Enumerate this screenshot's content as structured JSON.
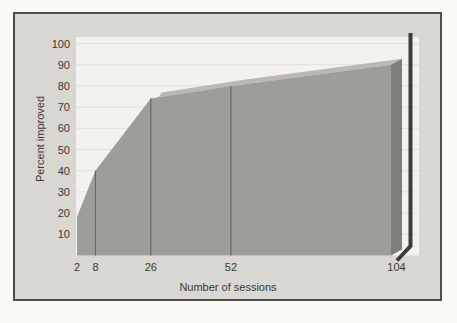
{
  "chart_data": {
    "type": "area",
    "style": "3d-extruded-area",
    "title": "",
    "xlabel": "Number of sessions",
    "ylabel": "Percent improved",
    "x": [
      2,
      8,
      26,
      52,
      104
    ],
    "values": [
      18,
      40,
      74,
      80,
      90
    ],
    "x_tick_labels": [
      "2",
      "8",
      "26",
      "52",
      "104"
    ],
    "y_ticks": [
      10,
      20,
      30,
      40,
      50,
      60,
      70,
      80,
      90,
      100
    ],
    "ylim": [
      0,
      100
    ],
    "xlim": [
      2,
      104
    ],
    "grid": "horizontal-faint",
    "legend_position": "none",
    "session_divider_lines_at_x": [
      8,
      26,
      52
    ],
    "colors": {
      "page_background": "#fbfaf7",
      "card_background": "#d9d7d2",
      "card_border": "#504e49",
      "plot_background": "#f3f2ee",
      "gridline": "#e2e0db",
      "area_front": "#9d9d9a",
      "area_top_bevel": "#bbb8b1",
      "area_right_bevel": "#7f7e7a",
      "divider_line": "#686865",
      "shadow_bar": "#3e3d3a",
      "text": "#3a3834"
    }
  }
}
